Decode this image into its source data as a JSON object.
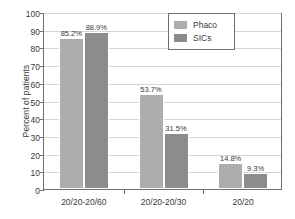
{
  "chart_data": {
    "type": "bar",
    "title": "",
    "xlabel": "",
    "ylabel": "Percent of patients",
    "categories": [
      "20/20-20/60",
      "20/20-20/30",
      "20/20"
    ],
    "ylim": [
      0,
      100
    ],
    "yticks": [
      0,
      10,
      20,
      30,
      40,
      50,
      60,
      70,
      80,
      90,
      100
    ],
    "ytick_labels": [
      "0",
      "10",
      "20",
      "30",
      "40",
      "50",
      "60",
      "70",
      "80",
      "90",
      "100"
    ],
    "grid": true,
    "legend_position": "top-right",
    "series": [
      {
        "name": "Phaco",
        "color": "#adadad",
        "values": [
          85.2,
          53.7,
          14.8
        ],
        "data_labels": [
          "85.2%",
          "53.7%",
          "14.8%"
        ]
      },
      {
        "name": "SICs",
        "color": "#8c8c8c",
        "values": [
          88.9,
          31.5,
          9.3
        ],
        "data_labels": [
          "88.9%",
          "31.5%",
          "9.3%"
        ]
      }
    ]
  },
  "legend": {
    "entries": [
      {
        "label": "Phaco",
        "color": "#adadad"
      },
      {
        "label": "SICs",
        "color": "#8c8c8c"
      }
    ]
  },
  "colors": {
    "phaco": "#adadad",
    "sics": "#8c8c8c",
    "axis": "#6f6f6f",
    "grid": "#d6d6d6",
    "text": "#3a3a3a",
    "background": "#ffffff"
  }
}
